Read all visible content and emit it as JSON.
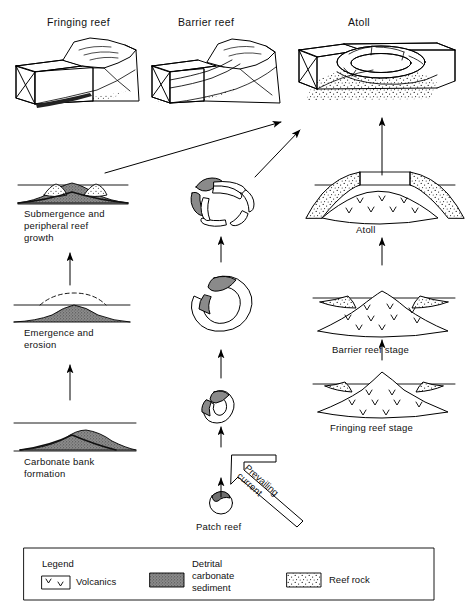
{
  "figure": {
    "title_row": [
      {
        "label": "Fringing reef"
      },
      {
        "label": "Barrier reef"
      },
      {
        "label": "Atoll"
      }
    ]
  },
  "block_diagrams": [
    {
      "name": "fringing-reef-block",
      "caption": "Fringing reef"
    },
    {
      "name": "barrier-reef-block",
      "caption": "Barrier reef"
    },
    {
      "name": "atoll-block",
      "caption": "Atoll"
    }
  ],
  "columns": {
    "carbonate_bank_pathway": {
      "stages": [
        {
          "label": "Submergence and\nperipheral reef\ngrowth"
        },
        {
          "label": "Emergence and\nerosion"
        },
        {
          "label": "Carbonate bank\nformation"
        }
      ]
    },
    "patch_reef_pathway": {
      "stages": [
        {
          "label": ""
        },
        {
          "label": ""
        },
        {
          "label": ""
        },
        {
          "label": "Patch reef"
        }
      ],
      "annotation": "Prevailing\ncurrent"
    },
    "volcanic_pathway": {
      "stages": [
        {
          "label": "Atoll"
        },
        {
          "label": "Barrier reef stage"
        },
        {
          "label": "Fringing reef stage"
        }
      ]
    }
  },
  "legend": {
    "title": "Legend",
    "items": [
      {
        "swatch": "volcanics-swatch",
        "glyph": "V",
        "label": "Volcanics"
      },
      {
        "swatch": "detrital-carbonate-swatch",
        "label": "Detrital\ncarbonate\nsediment"
      },
      {
        "swatch": "reef-rock-swatch",
        "label": "Reef rock"
      }
    ]
  },
  "colors": {
    "ink": "#000000",
    "paper": "#ffffff",
    "sediment_fill": "#6f6f6f",
    "reef_rock_fill": "#ffffff"
  }
}
